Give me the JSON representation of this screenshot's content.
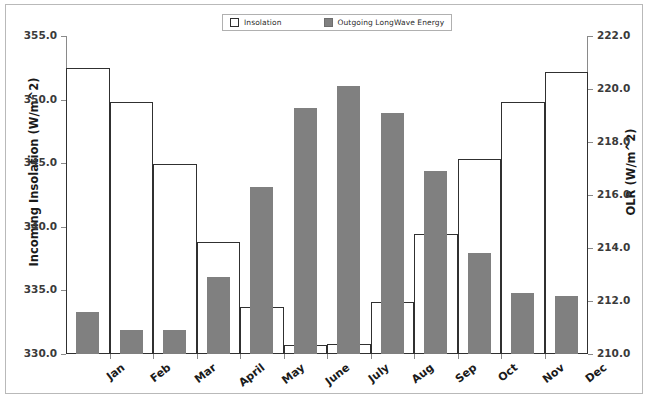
{
  "legend": {
    "position": "top-center",
    "entries": [
      {
        "label": "Insolation",
        "swatch": "open-square-swatch",
        "color": "#ffffff"
      },
      {
        "label": "Outgoing LongWave Energy",
        "swatch": "filled-square-swatch",
        "color": "#808080"
      }
    ]
  },
  "chart_data": {
    "type": "bar",
    "title": "",
    "subtitle": "",
    "xlabel": "",
    "ylabel": "Incoming Insolation (W/m^2)",
    "y2label": "OLR (W/m^2)",
    "grid": false,
    "legend_position": "top-center",
    "categories": [
      "Jan",
      "Feb",
      "Mar",
      "April",
      "May",
      "June",
      "July",
      "Aug",
      "Sep",
      "Oct",
      "Nov",
      "Dec"
    ],
    "ylim": [
      330.0,
      355.0
    ],
    "y2lim": [
      210.0,
      222.0
    ],
    "yticks": [
      "330.0",
      "335.0",
      "340.0",
      "345.0",
      "350.0",
      "355.0"
    ],
    "y2ticks": [
      "210.0",
      "212.0",
      "214.0",
      "216.0",
      "218.0",
      "220.0",
      "222.0"
    ],
    "ytick_values": [
      330.0,
      335.0,
      340.0,
      345.0,
      350.0,
      355.0
    ],
    "y2tick_values": [
      210.0,
      212.0,
      214.0,
      216.0,
      218.0,
      220.0,
      222.0
    ],
    "series": [
      {
        "name": "Insolation",
        "axis": "left",
        "units": "W/m^2",
        "style": "open-outline-bar",
        "color": "#ffffff",
        "edge_color": "#303030",
        "values": [
          352.5,
          349.8,
          344.9,
          338.8,
          333.7,
          330.7,
          330.8,
          334.1,
          339.4,
          345.3,
          349.8,
          352.2
        ]
      },
      {
        "name": "Outgoing LongWave Energy",
        "axis": "right",
        "units": "W/m^2",
        "style": "filled-bar",
        "color": "#808080",
        "edge_color": "#808080",
        "values": [
          211.6,
          210.9,
          210.9,
          212.9,
          216.3,
          219.3,
          220.1,
          219.1,
          216.9,
          213.8,
          212.3,
          212.2
        ]
      }
    ]
  }
}
